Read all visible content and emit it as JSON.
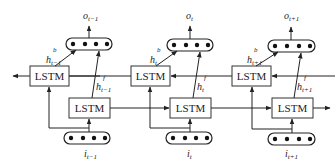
{
  "diagram": {
    "type": "bidirectional-lstm",
    "columns": [
      {
        "input_label": "i",
        "input_sub": "t−1",
        "output_label": "o",
        "output_sub": "t−1",
        "backward_label": "h",
        "backward_sup": "b",
        "backward_sub": "t−1",
        "forward_label": "h",
        "forward_sup": "f",
        "forward_sub": "t−1",
        "backward_cell": "LSTM",
        "forward_cell": "LSTM"
      },
      {
        "input_label": "i",
        "input_sub": "t",
        "output_label": "o",
        "output_sub": "t",
        "backward_label": "h",
        "backward_sup": "b",
        "backward_sub": "t",
        "forward_label": "h",
        "forward_sup": "f",
        "forward_sub": "t",
        "backward_cell": "LSTM",
        "forward_cell": "LSTM"
      },
      {
        "input_label": "i",
        "input_sub": "t+1",
        "output_label": "o",
        "output_sub": "t+1",
        "backward_label": "h",
        "backward_sup": "b",
        "backward_sub": "t+1",
        "forward_label": "h",
        "forward_sup": "f",
        "forward_sub": "t+1",
        "backward_cell": "LSTM",
        "forward_cell": "LSTM"
      }
    ],
    "vector_dots": 4,
    "colors": {
      "stroke": "#222222",
      "background": "#ffffff"
    }
  }
}
